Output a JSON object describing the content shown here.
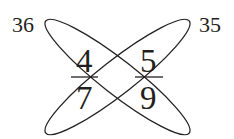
{
  "diagram": {
    "type": "crossed-ellipses-fraction-puzzle",
    "corner_labels": {
      "top_left": "36",
      "top_right": "35"
    },
    "fractions": [
      {
        "position": "left",
        "numerator": "4",
        "denominator": "7"
      },
      {
        "position": "right",
        "numerator": "5",
        "denominator": "9"
      }
    ],
    "colors": {
      "ink": "#231f20",
      "background": "#ffffff"
    }
  }
}
